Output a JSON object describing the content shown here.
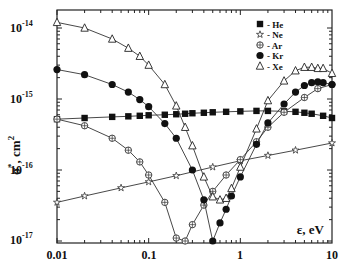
{
  "chart_data": {
    "type": "line",
    "title": "",
    "xlabel": "ε, eV",
    "ylabel": "σ*, cm²",
    "xscale": "log",
    "yscale": "log",
    "xlim": [
      0.01,
      10
    ],
    "ylim": [
      1e-17,
      1.3e-14
    ],
    "x_ticks": [
      "0.01",
      "0.1",
      "1",
      "10"
    ],
    "y_ticks": [
      "10-14",
      "10-15",
      "10-16",
      "10-17"
    ],
    "y_tick_values": [
      1e-14,
      1e-15,
      1e-16,
      1e-17
    ],
    "grid": false,
    "legend_position": "upper right",
    "series": [
      {
        "name": "He",
        "legend": "- He",
        "marker": "filled-square",
        "x": [
          0.01,
          0.02,
          0.04,
          0.06,
          0.08,
          0.1,
          0.15,
          0.2,
          0.25,
          0.3,
          0.4,
          0.5,
          0.7,
          1.0,
          1.5,
          2.0,
          3.0,
          4.0,
          5.0,
          6.0,
          8.0,
          10.0
        ],
        "y": [
          5.2e-16,
          5.4e-16,
          5.6e-16,
          5.7e-16,
          5.8e-16,
          5.9e-16,
          6e-16,
          6.1e-16,
          6.2e-16,
          6.3e-16,
          6.4e-16,
          6.5e-16,
          6.6e-16,
          6.7e-16,
          6.8e-16,
          6.8e-16,
          6.7e-16,
          6.6e-16,
          6.4e-16,
          6.2e-16,
          5.8e-16,
          5.4e-16
        ]
      },
      {
        "name": "Ne",
        "legend": "- Ne",
        "marker": "open-star",
        "x": [
          0.01,
          0.02,
          0.05,
          0.1,
          0.2,
          0.5,
          1.0,
          2.0,
          4.0,
          10.0
        ],
        "y": [
          3.5e-17,
          4.3e-17,
          5.6e-17,
          6.8e-17,
          8.3e-17,
          1.1e-16,
          1.35e-16,
          1.6e-16,
          1.9e-16,
          2.4e-16
        ]
      },
      {
        "name": "Ar",
        "legend": "- Ar",
        "marker": "circled-plus",
        "x": [
          0.01,
          0.02,
          0.04,
          0.06,
          0.08,
          0.1,
          0.15,
          0.2,
          0.25,
          0.3,
          0.4,
          0.5,
          0.7,
          1.0,
          1.5,
          2.0,
          3.0,
          5.0,
          7.0,
          10.0
        ],
        "y": [
          5.2e-16,
          4.2e-16,
          2.8e-16,
          1.9e-16,
          1.3e-16,
          8.5e-17,
          3.5e-17,
          1.1e-17,
          1e-17,
          1.7e-17,
          3.2e-17,
          5e-17,
          8.5e-17,
          1.4e-16,
          2.5e-16,
          4e-16,
          6.5e-16,
          1.05e-15,
          1.4e-15,
          1.6e-15
        ]
      },
      {
        "name": "Kr",
        "legend": "- Kr",
        "marker": "filled-circle",
        "x": [
          0.01,
          0.02,
          0.04,
          0.06,
          0.08,
          0.1,
          0.15,
          0.2,
          0.3,
          0.4,
          0.5,
          0.6,
          0.7,
          0.8,
          1.0,
          1.5,
          2.0,
          3.0,
          4.0,
          5.0,
          6.0,
          7.0,
          8.0,
          10.0
        ],
        "y": [
          2.6e-15,
          2.2e-15,
          1.6e-15,
          1.25e-15,
          9.8e-16,
          7.8e-16,
          4.5e-16,
          2.8e-16,
          1e-16,
          3.8e-17,
          1e-17,
          1.8e-17,
          2.8e-17,
          4.3e-17,
          8e-17,
          2.3e-16,
          4.6e-16,
          8.5e-16,
          1.25e-15,
          1.55e-15,
          1.7e-15,
          1.75e-15,
          1.7e-15,
          1.6e-15
        ]
      },
      {
        "name": "Xe",
        "legend": "- Xe",
        "marker": "open-triangle",
        "x": [
          0.01,
          0.02,
          0.04,
          0.06,
          0.08,
          0.1,
          0.15,
          0.2,
          0.25,
          0.3,
          0.4,
          0.5,
          0.6,
          0.7,
          0.8,
          1.0,
          1.5,
          2.0,
          3.0,
          4.0,
          5.0,
          6.0,
          7.0,
          8.0,
          10.0
        ],
        "y": [
          1.2e-14,
          1e-14,
          7e-15,
          5.2e-15,
          4e-15,
          3e-15,
          1.6e-15,
          8e-16,
          4e-16,
          2.2e-16,
          8e-17,
          4.2e-17,
          3.8e-17,
          4e-17,
          5.5e-17,
          1.1e-16,
          3.8e-16,
          9.5e-16,
          1.8e-15,
          2.5e-15,
          2.8e-15,
          2.8e-15,
          2.7e-15,
          2.7e-15,
          2.3e-15
        ]
      }
    ]
  },
  "legend": {
    "items": [
      {
        "label": "- He",
        "marker": "filled-square"
      },
      {
        "label": "- Ne",
        "marker": "open-star"
      },
      {
        "label": "- Ar",
        "marker": "circled-plus"
      },
      {
        "label": "- Kr",
        "marker": "filled-circle"
      },
      {
        "label": "- Xe",
        "marker": "open-triangle"
      }
    ]
  },
  "axes": {
    "xlabel": "ε, eV",
    "ylabel_main": "σ",
    "ylabel_sup": "*",
    "ylabel_unit": ", cm",
    "ylabel_unit_sup": "2",
    "x_tick_labels": [
      "0.01",
      "0.1",
      "1",
      "10"
    ],
    "y_tick_bases": [
      "10",
      "10",
      "10",
      "10"
    ],
    "y_tick_exps": [
      "-14",
      "-15",
      "-16",
      "-17"
    ]
  }
}
